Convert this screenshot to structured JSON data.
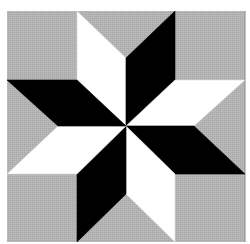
{
  "figure": {
    "colors": {
      "background": "#ffffff",
      "field": "#b2b2b2",
      "light": "#ffffff",
      "dark": "#000000",
      "edge": "#8a8a8a"
    },
    "field": {
      "x": 7,
      "y": 11,
      "w": 238,
      "h": 231
    },
    "center": [
      126,
      126
    ],
    "diamonds": [
      {
        "name": "top-left-light",
        "fill": "light",
        "points": "126,126 77,80 77,11 126,58"
      },
      {
        "name": "top-right-dark",
        "fill": "dark",
        "points": "126,126 126,58 175,11 175,80"
      },
      {
        "name": "right-upper-light",
        "fill": "light",
        "points": "126,126 175,80 245,80 194,126"
      },
      {
        "name": "right-lower-dark",
        "fill": "dark",
        "points": "126,126 194,126 245,174 175,174"
      },
      {
        "name": "bottom-right-light",
        "fill": "light",
        "points": "126,126 175,174 175,242 126,194"
      },
      {
        "name": "bottom-left-dark",
        "fill": "dark",
        "points": "126,126 126,194 77,242 77,174"
      },
      {
        "name": "left-lower-light",
        "fill": "light",
        "points": "126,126 77,174 7,174 58,126"
      },
      {
        "name": "left-upper-dark",
        "fill": "dark",
        "points": "126,126 58,126 7,80 77,80"
      }
    ]
  }
}
